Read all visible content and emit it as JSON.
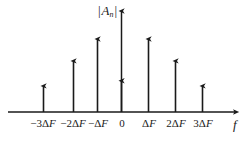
{
  "figure": {
    "name": "line-spectrum-of-periodic-signal",
    "axis_color": "#1a1a1a",
    "stem_color": "#1a1a1a",
    "background": "#ffffff",
    "y_axis_title": {
      "open_bar": "|",
      "symbol": "A",
      "subscript": "n",
      "close_bar": "|"
    },
    "x_axis_title": "f",
    "origin_label": "0"
  },
  "chart_data": {
    "type": "bar",
    "title": "",
    "subtitle": "",
    "xlabel": "f",
    "ylabel": "|A_n|",
    "grid": false,
    "legend": null,
    "categories": [
      "-3ΔF",
      "-2ΔF",
      "-ΔF",
      "0",
      "ΔF",
      "2ΔF",
      "3ΔF"
    ],
    "tick_labels": [
      {
        "sign": "−",
        "coef": "3",
        "delta": "Δ",
        "unit": "F",
        "text": "−3ΔF"
      },
      {
        "sign": "−",
        "coef": "2",
        "delta": "Δ",
        "unit": "F",
        "text": "−2ΔF"
      },
      {
        "sign": "−",
        "coef": "",
        "delta": "Δ",
        "unit": "F",
        "text": "−ΔF"
      },
      {
        "sign": "",
        "coef": "0",
        "delta": "",
        "unit": "",
        "text": "0"
      },
      {
        "sign": "",
        "coef": "",
        "delta": "Δ",
        "unit": "F",
        "text": "ΔF"
      },
      {
        "sign": "",
        "coef": "2",
        "delta": "Δ",
        "unit": "F",
        "text": "2ΔF"
      },
      {
        "sign": "",
        "coef": "3",
        "delta": "Δ",
        "unit": "F",
        "text": "3ΔF"
      }
    ],
    "x": [
      -3,
      -2,
      -1,
      0,
      1,
      2,
      3
    ],
    "values": [
      0.25,
      0.49,
      0.7,
      0.3,
      0.7,
      0.49,
      0.25
    ],
    "xlim": [
      -3.6,
      3.9
    ],
    "ylim": [
      0,
      1.0
    ]
  }
}
